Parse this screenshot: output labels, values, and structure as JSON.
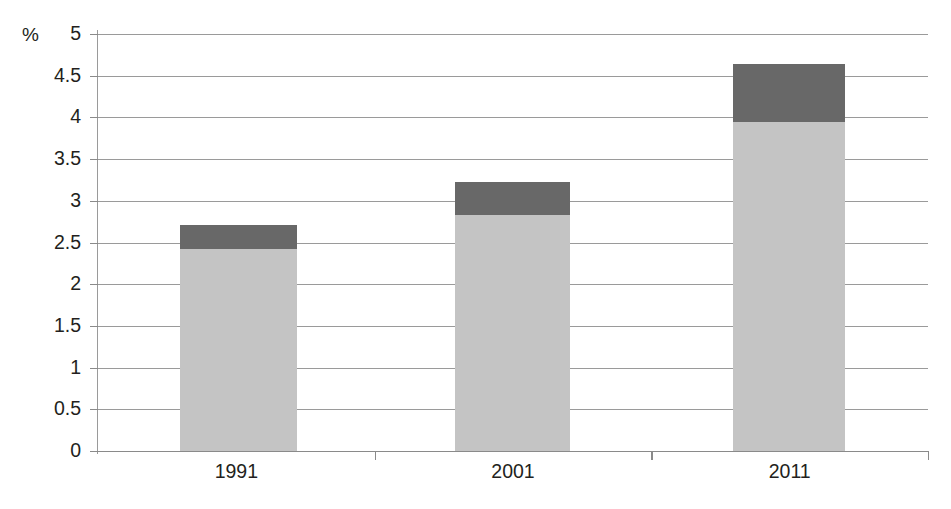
{
  "chart": {
    "unit_label": "%",
    "background": "#ffffff",
    "gridline_color": "#9a9a9a",
    "axis_color": "#8a8a8a",
    "text_color": "#231f20"
  },
  "chart_data": {
    "type": "bar",
    "stacked": true,
    "title": "",
    "subtitle": "",
    "xlabel": "",
    "ylabel": "%",
    "categories": [
      "1991",
      "2001",
      "2011"
    ],
    "ylim": [
      0,
      5
    ],
    "ytick_values": [
      0,
      0.5,
      1,
      1.5,
      2,
      2.5,
      3,
      3.5,
      4,
      4.5,
      5
    ],
    "ytick_labels": [
      "0",
      "0.5",
      "1",
      "1.5",
      "2",
      "2.5",
      "3",
      "3.5",
      "4",
      "4.5",
      "5"
    ],
    "grid": true,
    "legend": "none",
    "series": [
      {
        "name": "lower-segment",
        "color": "#c4c4c4",
        "values": [
          2.42,
          2.83,
          3.95
        ]
      },
      {
        "name": "upper-segment",
        "color": "#686868",
        "values": [
          0.29,
          0.39,
          0.69
        ]
      }
    ],
    "totals": [
      2.71,
      3.22,
      4.64
    ],
    "annotations": []
  }
}
